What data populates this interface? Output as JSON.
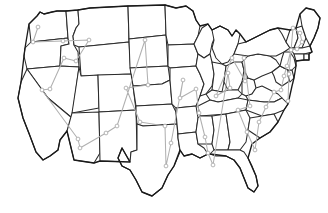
{
  "figure": {
    "kind": "map",
    "title": "United States State Outline Map with Tour Route Overlay",
    "width": 328,
    "height": 213,
    "background_color": "#ffffff",
    "has_text_labels": false,
    "has_legend": false,
    "has_axes": false,
    "projection_note": "continental united states, lower 48"
  },
  "style": {
    "state_border_color": "#2b2b2b",
    "national_outline_color": "#1a1a1a",
    "state_fill_color": "#ffffff",
    "route_line_color": "#b0b0b0",
    "route_node_fill": "#ffffff",
    "route_node_stroke": "#a8a8a8",
    "route_line_width": 1.05,
    "state_border_width": 1.05,
    "node_radius": 1.9
  },
  "route": {
    "name": "tour-route",
    "closed": false,
    "node_count": 49,
    "description": "light gray polyline connecting one visited point per state, drawn with small open circle markers at each stop",
    "points": [
      [
        38,
        27
      ],
      [
        33,
        42
      ],
      [
        63,
        41
      ],
      [
        89,
        40
      ],
      [
        76,
        61
      ],
      [
        64,
        58
      ],
      [
        50,
        89
      ],
      [
        42,
        90
      ],
      [
        78,
        139
      ],
      [
        80,
        148
      ],
      [
        106,
        133
      ],
      [
        117,
        126
      ],
      [
        145,
        40
      ],
      [
        148,
        85
      ],
      [
        126,
        88
      ],
      [
        140,
        122
      ],
      [
        165,
        126
      ],
      [
        166,
        166
      ],
      [
        171,
        143
      ],
      [
        183,
        80
      ],
      [
        180,
        98
      ],
      [
        196,
        89
      ],
      [
        199,
        113
      ],
      [
        205,
        137
      ],
      [
        208,
        153
      ],
      [
        213,
        165
      ],
      [
        228,
        73
      ],
      [
        230,
        88
      ],
      [
        216,
        96
      ],
      [
        232,
        58
      ],
      [
        245,
        81
      ],
      [
        244,
        58
      ],
      [
        250,
        106
      ],
      [
        238,
        110
      ],
      [
        247,
        132
      ],
      [
        255,
        150
      ],
      [
        259,
        122
      ],
      [
        266,
        107
      ],
      [
        274,
        92
      ],
      [
        281,
        90
      ],
      [
        284,
        76
      ],
      [
        287,
        66
      ],
      [
        291,
        50
      ],
      [
        297,
        49
      ],
      [
        302,
        42
      ],
      [
        300,
        33
      ],
      [
        293,
        28
      ],
      [
        289,
        74
      ],
      [
        288,
        101
      ]
    ]
  },
  "route_segments": [
    {
      "name": "pacific-northwest",
      "from": "Washington",
      "to": "Idaho"
    },
    {
      "name": "great-basin",
      "from": "Nevada",
      "to": "Utah"
    },
    {
      "name": "desert-southwest",
      "from": "Arizona",
      "to": "New Mexico"
    },
    {
      "name": "northern-plains",
      "from": "North Dakota",
      "to": "Nebraska"
    },
    {
      "name": "texas-gulf",
      "from": "Texas",
      "to": "Louisiana"
    },
    {
      "name": "great-lakes",
      "from": "Minnesota",
      "to": "Ohio"
    },
    {
      "name": "deep-south",
      "from": "Mississippi",
      "to": "Georgia"
    },
    {
      "name": "appalachia",
      "from": "Tennessee",
      "to": "Virginia"
    },
    {
      "name": "mid-atlantic",
      "from": "Maryland",
      "to": "New Jersey"
    },
    {
      "name": "new-england",
      "from": "Connecticut",
      "to": "Maine"
    }
  ]
}
